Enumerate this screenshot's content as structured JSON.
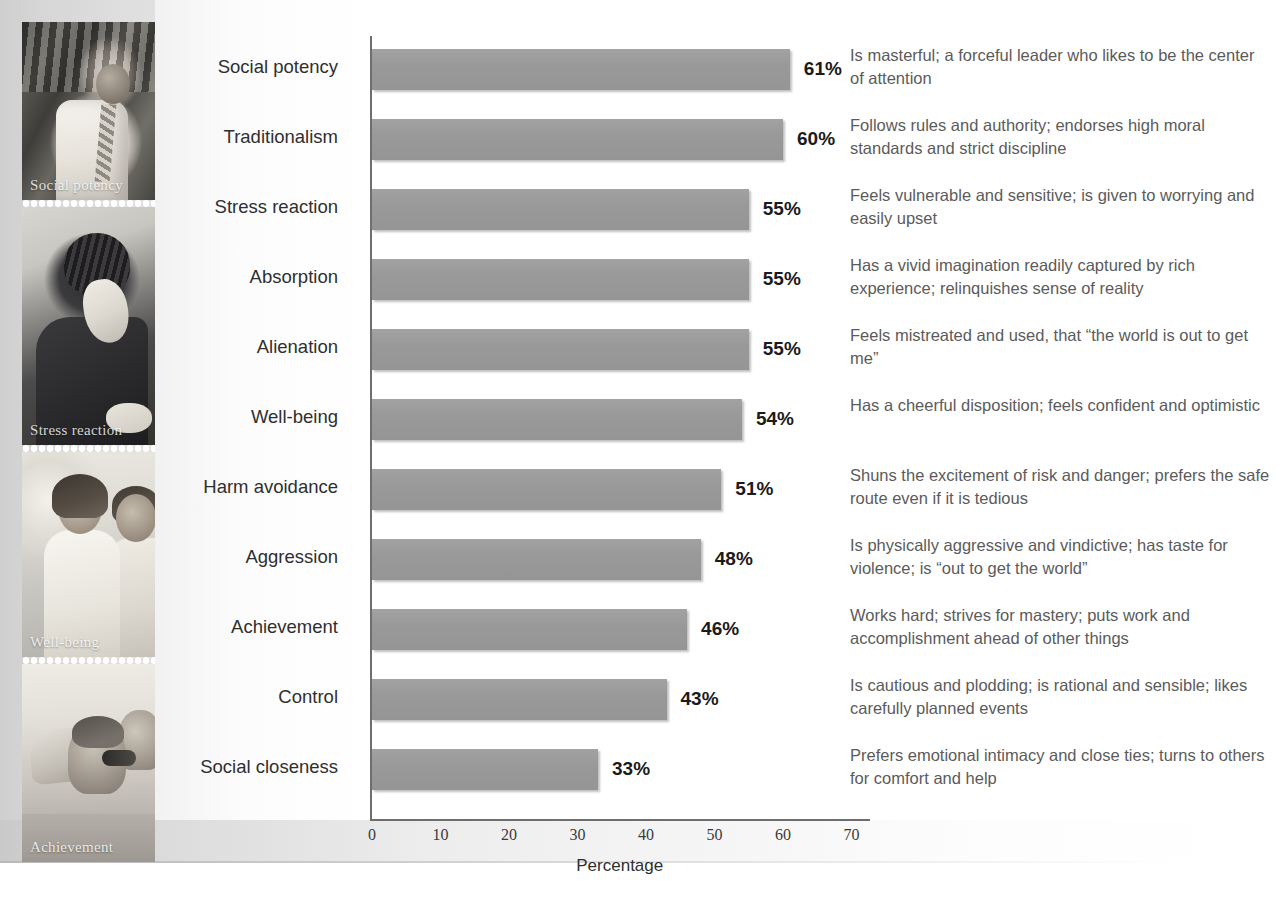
{
  "chart_data": {
    "type": "bar",
    "orientation": "horizontal",
    "title": "",
    "xlabel": "Percentage",
    "ylabel": "",
    "xlim": [
      0,
      75
    ],
    "xticks": [
      "0",
      "10",
      "20",
      "30",
      "40",
      "50",
      "60",
      "70"
    ],
    "grid": false,
    "legend": null,
    "bar_color": "#999999",
    "categories": [
      "Social potency",
      "Traditionalism",
      "Stress reaction",
      "Absorption",
      "Alienation",
      "Well-being",
      "Harm avoidance",
      "Aggression",
      "Achievement",
      "Control",
      "Social closeness"
    ],
    "values": [
      61,
      60,
      55,
      55,
      55,
      54,
      51,
      48,
      46,
      43,
      33
    ],
    "value_labels": [
      "61%",
      "60%",
      "55%",
      "55%",
      "55%",
      "54%",
      "51%",
      "48%",
      "46%",
      "43%",
      "33%"
    ],
    "descriptions": [
      "Is masterful; a forceful leader who likes to be the center of attention",
      "Follows rules and authority; endorses high moral standards and strict discipline",
      "Feels vulnerable and sensitive; is given to worrying and easily upset",
      "Has a vivid imagination readily captured by rich experience; relinquishes sense of reality",
      "Feels mistreated and used, that “the world is out to get me”",
      "Has a cheerful disposition; feels confident and optimistic",
      "Shuns the excitement of risk and danger; prefers the safe route even if it is tedious",
      "Is physically aggressive and vindictive; has taste for violence; is “out to get the world”",
      "Works hard; strives for mastery; puts work and accomplishment ahead of other things",
      "Is cautious and plodding; is rational and sensible; likes carefully planned events",
      "Prefers emotional intimacy and close ties; turns to others for comfort and help"
    ]
  },
  "photos": [
    {
      "caption": "Social potency"
    },
    {
      "caption": "Stress reaction"
    },
    {
      "caption": "Well-being"
    },
    {
      "caption": "Achievement"
    }
  ]
}
